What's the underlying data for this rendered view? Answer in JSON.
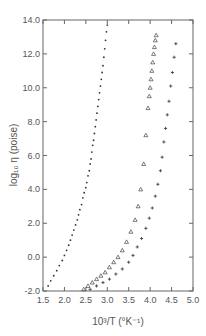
{
  "chart_data": {
    "type": "scatter",
    "title": "",
    "xlabel": "10³/T (°K⁻¹)",
    "ylabel": "log₁₀ η (poise)",
    "xlim": [
      1.5,
      5.0
    ],
    "ylim": [
      -2.0,
      14.0
    ],
    "xticks": [
      "1.5",
      "2.0",
      "2.5",
      "3.0",
      "3.5",
      "4.0",
      "4.5",
      "5.0"
    ],
    "yticks": [
      "-2.0",
      "0.0",
      "2.0",
      "4.0",
      "6.0",
      "8.0",
      "10.0",
      "12.0",
      "14.0"
    ],
    "grid": false,
    "legend": null,
    "series": [
      {
        "name": "series-dots",
        "marker": "dot",
        "x": [
          1.62,
          1.68,
          1.75,
          1.82,
          1.88,
          1.95,
          2.0,
          2.05,
          2.1,
          2.14,
          2.18,
          2.22,
          2.26,
          2.3,
          2.33,
          2.36,
          2.4,
          2.43,
          2.46,
          2.5,
          2.52,
          2.55,
          2.58,
          2.6,
          2.62,
          2.64,
          2.66,
          2.68,
          2.7,
          2.72,
          2.74,
          2.76,
          2.78,
          2.8,
          2.82,
          2.84,
          2.86,
          2.88,
          2.9,
          2.92,
          2.94,
          2.96,
          2.98,
          3.0
        ],
        "y": [
          -1.7,
          -1.4,
          -1.1,
          -0.8,
          -0.5,
          -0.2,
          0.1,
          0.4,
          0.7,
          1.0,
          1.3,
          1.6,
          1.9,
          2.2,
          2.5,
          2.8,
          3.1,
          3.5,
          3.8,
          4.1,
          4.4,
          4.8,
          5.1,
          5.5,
          5.8,
          6.2,
          6.6,
          6.9,
          7.3,
          7.7,
          8.1,
          8.5,
          8.9,
          9.3,
          9.7,
          10.1,
          10.5,
          10.9,
          11.3,
          11.8,
          12.3,
          12.8,
          13.3,
          13.7
        ]
      },
      {
        "name": "series-triangles",
        "marker": "triangle",
        "x": [
          2.45,
          2.55,
          2.65,
          2.75,
          2.85,
          2.95,
          3.05,
          3.15,
          3.25,
          3.35,
          3.45,
          3.55,
          3.65,
          3.72,
          3.78,
          3.85,
          3.9,
          3.95,
          3.98,
          4.0,
          4.02,
          4.04,
          4.06,
          4.08,
          4.1,
          4.12,
          4.14
        ],
        "y": [
          -1.9,
          -1.7,
          -1.5,
          -1.3,
          -1.1,
          -0.9,
          -0.6,
          -0.3,
          0.0,
          0.4,
          0.9,
          1.5,
          2.2,
          3.0,
          4.0,
          5.5,
          7.2,
          8.8,
          9.5,
          10.0,
          10.5,
          11.0,
          11.5,
          12.0,
          12.4,
          12.8,
          13.1
        ]
      },
      {
        "name": "series-plus",
        "marker": "plus",
        "x": [
          2.6,
          2.75,
          2.9,
          3.05,
          3.2,
          3.35,
          3.5,
          3.6,
          3.7,
          3.8,
          3.9,
          3.98,
          4.05,
          4.12,
          4.18,
          4.24,
          4.28,
          4.32,
          4.36,
          4.4,
          4.44,
          4.48,
          4.52,
          4.56,
          4.6
        ],
        "y": [
          -1.9,
          -1.7,
          -1.5,
          -1.3,
          -1.0,
          -0.7,
          -0.3,
          0.1,
          0.6,
          1.1,
          1.7,
          2.3,
          2.9,
          3.6,
          4.3,
          5.1,
          5.9,
          6.8,
          7.6,
          8.4,
          9.2,
          10.1,
          10.9,
          11.8,
          12.6
        ]
      }
    ]
  }
}
